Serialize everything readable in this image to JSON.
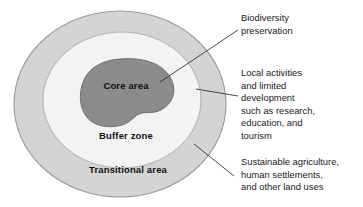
{
  "figure": {
    "background_color": "#ffffff"
  },
  "zones": [
    {
      "id": "transitional",
      "label": "Transitional area",
      "fill_color": "#d4d4d4",
      "stroke_color": "#9a9a9a",
      "label_x": 128,
      "label_y": 173
    },
    {
      "id": "buffer",
      "label": "Buffer zone",
      "fill_color": "#f3f3f1",
      "stroke_color": "#b0b0b0",
      "label_x": 126,
      "label_y": 139
    },
    {
      "id": "core",
      "label": "Core area",
      "fill_color": "#8b8b8b",
      "stroke_color": "#6f6f6f",
      "label_x": 126,
      "label_y": 89
    }
  ],
  "annotations": [
    {
      "id": "biodiversity",
      "target_zone": "core",
      "lines": [
        "Biodiversity",
        "preservation"
      ],
      "leader": {
        "x1": 238,
        "y1": 30,
        "x2": 160,
        "y2": 82
      }
    },
    {
      "id": "buffer_uses",
      "target_zone": "buffer",
      "lines": [
        "Local activities",
        "and limited",
        "development",
        "such as research,",
        "education, and",
        "tourism"
      ],
      "leader": {
        "x1": 238,
        "y1": 96,
        "x2": 196,
        "y2": 89
      }
    },
    {
      "id": "transitional_uses",
      "target_zone": "transitional",
      "lines": [
        "Sustainable agriculture,",
        "human settlements,",
        "and other land uses"
      ],
      "leader": {
        "x1": 234,
        "y1": 176,
        "x2": 194,
        "y2": 144
      }
    }
  ],
  "leader_line_color": "#2b2b2b"
}
